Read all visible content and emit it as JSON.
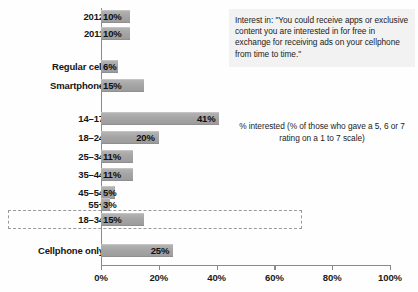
{
  "chart_data": {
    "type": "bar",
    "orientation": "horizontal",
    "title": "",
    "xlabel": "",
    "ylabel": "",
    "xlim": [
      0,
      100
    ],
    "xticks": [
      0,
      20,
      40,
      60,
      80,
      100
    ],
    "xtick_labels": [
      "0%",
      "20%",
      "40%",
      "60%",
      "80%",
      "100%"
    ],
    "grid": false,
    "legend_position": "right",
    "categories": [
      "2012",
      "2011",
      "Regular cell",
      "Smartphone",
      "14–17",
      "18–24",
      "25–34",
      "35–44",
      "45–54",
      "55+",
      "18–34",
      "Cellphone only"
    ],
    "values": [
      10,
      10,
      6,
      15,
      41,
      20,
      11,
      11,
      5,
      3,
      15,
      25
    ],
    "value_labels": [
      "10%",
      "10%",
      "6%",
      "15%",
      "41%",
      "20%",
      "11%",
      "11%",
      "5%",
      "3%",
      "15%",
      "25%"
    ],
    "annotations": [
      "Interest in: \"You could receive apps or exclusive content you are interested in for free in exchange for receiving ads on your cellphone from time to time.\"",
      "% interested (% of those who gave a 5, 6 or 7 rating on a 1 to 7 scale)"
    ],
    "highlighted_category": "18–34",
    "bar_color": "#a5a5a5",
    "axis_color": "#8a8a8a",
    "text_color": "#151515"
  },
  "rows": [
    {
      "label": "2012",
      "value_label": "10%",
      "value": 10,
      "top": 10,
      "inside": true
    },
    {
      "label": "2011",
      "value_label": "10%",
      "value": 10,
      "top": 27,
      "inside": true
    },
    {
      "label": "Regular cell",
      "value_label": "6%",
      "value": 6,
      "top": 60,
      "inside": true
    },
    {
      "label": "Smartphone",
      "value_label": "15%",
      "value": 15,
      "top": 79,
      "inside": true
    },
    {
      "label": "14–17",
      "value_label": "41%",
      "value": 41,
      "top": 112,
      "inside": true
    },
    {
      "label": "18–24",
      "value_label": "20%",
      "value": 20,
      "top": 131,
      "inside": true
    },
    {
      "label": "25–34",
      "value_label": "11%",
      "value": 11,
      "top": 150,
      "inside": true
    },
    {
      "label": "35–44",
      "value_label": "11%",
      "value": 11,
      "top": 168,
      "inside": true
    },
    {
      "label": "45–54",
      "value_label": "5%",
      "value": 5,
      "top": 186,
      "inside": true
    },
    {
      "label": "55+",
      "value_label": "3%",
      "value": 3,
      "top": 198,
      "inside": true
    },
    {
      "label": "18–34",
      "value_label": "15%",
      "value": 15,
      "top": 213,
      "inside": true
    },
    {
      "label": "Cellphone only",
      "value_label": "25%",
      "value": 25,
      "top": 244,
      "inside": true
    }
  ],
  "axis": {
    "ticks": [
      {
        "label": "0%",
        "value": 0
      },
      {
        "label": "20%",
        "value": 20
      },
      {
        "label": "40%",
        "value": 40
      },
      {
        "label": "60%",
        "value": 60
      },
      {
        "label": "80%",
        "value": 80
      },
      {
        "label": "100%",
        "value": 100
      }
    ]
  },
  "callout": {
    "text": "Interest in: \"You could receive apps or exclusive content you are interested in for free in exchange for receiving ads on your cellphone from time to time.\""
  },
  "legend": {
    "text": "% interested (% of those who gave a 5, 6 or 7 rating on a 1 to 7 scale)"
  }
}
